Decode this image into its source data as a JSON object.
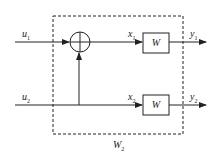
{
  "diagram": {
    "inputs": [
      {
        "name": "u",
        "sub": "1"
      },
      {
        "name": "u",
        "sub": "2"
      }
    ],
    "intermediates": [
      {
        "name": "x",
        "sub": "1"
      },
      {
        "name": "x",
        "sub": "2"
      }
    ],
    "outputs": [
      {
        "name": "y",
        "sub": "1"
      },
      {
        "name": "y",
        "sub": "2"
      }
    ],
    "blocks": [
      {
        "label": "W"
      },
      {
        "label": "W"
      }
    ],
    "summing_junction": {
      "symbol": "+"
    },
    "enclosure": {
      "name": "W",
      "sub": "2"
    },
    "colors": {
      "line": "#222222",
      "background": "#ffffff"
    }
  }
}
